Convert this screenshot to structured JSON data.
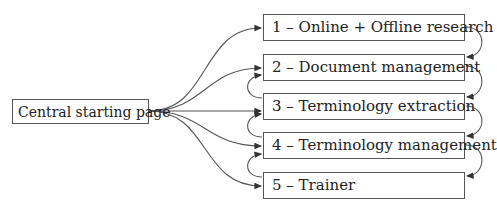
{
  "diagram": {
    "central": {
      "label": "Central starting page"
    },
    "steps": [
      {
        "label": "1 – Online + Offline research"
      },
      {
        "label": "2 – Document management"
      },
      {
        "label": "3 – Terminology extraction"
      },
      {
        "label": "4 – Terminology management"
      },
      {
        "label": "5 – Trainer"
      }
    ],
    "edges": {
      "central_to_steps": [
        "1",
        "2",
        "3",
        "4",
        "5"
      ],
      "forward_right_loops": [
        [
          "1",
          "2"
        ],
        [
          "2",
          "3"
        ],
        [
          "3",
          "4"
        ],
        [
          "4",
          "5"
        ]
      ],
      "backward_left_loops": [
        [
          "3",
          "2"
        ],
        [
          "4",
          "3"
        ],
        [
          "5",
          "4"
        ]
      ]
    },
    "colors": {
      "line": "#555555",
      "border": "#555555",
      "text": "#222222"
    }
  }
}
